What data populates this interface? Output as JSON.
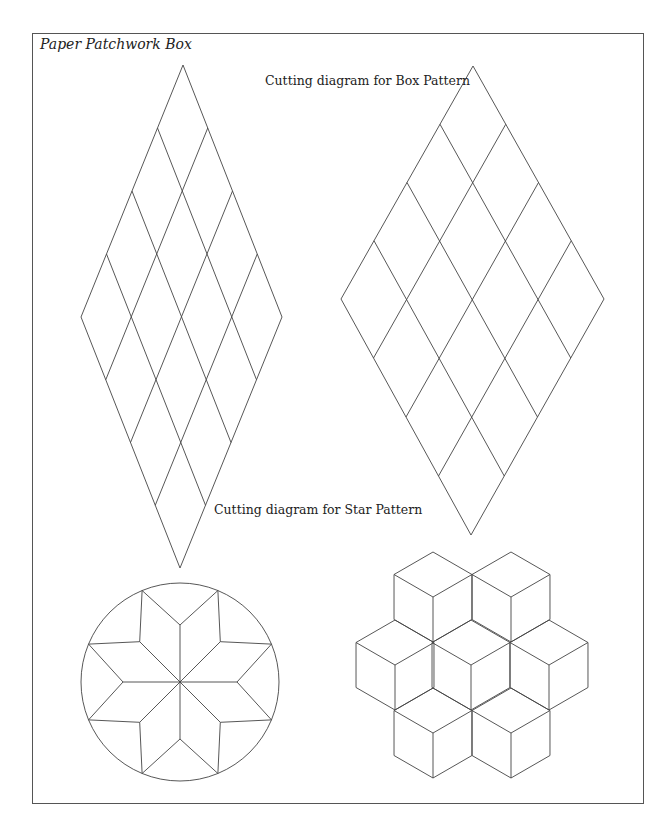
{
  "page": {
    "title": "Paper Patchwork Box",
    "background": "#ffffff",
    "line_color": "#444444"
  },
  "captions": {
    "box_pattern": "Cutting diagram for Box Pattern",
    "star_pattern": "Cutting diagram for Star Pattern"
  },
  "figures": [
    {
      "id": "star-cutting-diamond",
      "type": "rhombus-grid",
      "rows": 4,
      "cols": 4,
      "top": [
        183,
        65
      ],
      "left": [
        81,
        317
      ],
      "right": [
        282,
        317
      ],
      "bottom": [
        180,
        568
      ]
    },
    {
      "id": "box-cutting-diamond",
      "type": "rhombus-grid",
      "rows": 4,
      "cols": 4,
      "top": [
        473,
        66
      ],
      "left": [
        341,
        299
      ],
      "right": [
        604,
        299
      ],
      "bottom": [
        471,
        535
      ]
    },
    {
      "id": "eight-point-star",
      "type": "star-in-circle",
      "center": [
        180,
        682
      ],
      "circle_radius": 99,
      "points": 8,
      "valley_radius": 57
    },
    {
      "id": "tumbling-blocks",
      "type": "cube-rosette",
      "cube_count": 7,
      "edge": 45,
      "cube_centers": [
        [
          433,
          597
        ],
        [
          511,
          597
        ],
        [
          395,
          665
        ],
        [
          471,
          665
        ],
        [
          549,
          665
        ],
        [
          433,
          733
        ],
        [
          511,
          733
        ]
      ]
    }
  ]
}
